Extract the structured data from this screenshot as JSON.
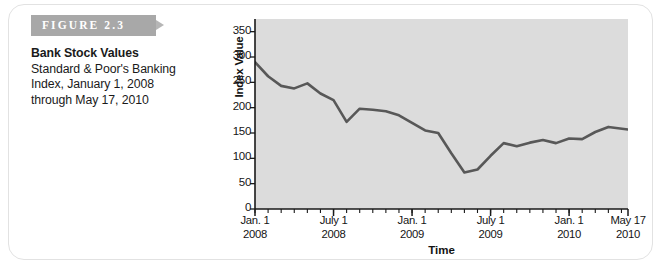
{
  "figure": {
    "banner_label": "FIGURE 2.3",
    "title": "Bank Stock Values",
    "subtitle_line1": "Standard & Poor's Banking",
    "subtitle_line2": "Index, January 1, 2008",
    "subtitle_line3": "through May 17, 2010"
  },
  "colors": {
    "banner": "#a8a8a8",
    "plot_background": "#dcdcdc",
    "line": "#585858",
    "axis": "#1a1a1a",
    "border": "#e2e2e2"
  },
  "chart_data": {
    "type": "line",
    "title": "Bank Stock Values",
    "xlabel": "Time",
    "ylabel": "Index Value",
    "ylim": [
      0,
      375
    ],
    "yticks": [
      0,
      50,
      100,
      150,
      200,
      250,
      300,
      350
    ],
    "ytick_labels": [
      "0",
      "50",
      "100",
      "150",
      "200",
      "250",
      "300",
      "350"
    ],
    "grid": false,
    "legend": "none",
    "xlim": [
      0,
      28.5
    ],
    "xtick_positions": [
      0,
      6,
      12,
      18,
      24,
      28.5
    ],
    "xtick_labels": [
      {
        "line1": "Jan. 1",
        "line2": "2008"
      },
      {
        "line1": "July 1",
        "line2": "2008"
      },
      {
        "line1": "Jan. 1",
        "line2": "2009"
      },
      {
        "line1": "July 1",
        "line2": "2009"
      },
      {
        "line1": "Jan. 1",
        "line2": "2010"
      },
      {
        "line1": "May 17",
        "line2": "2010"
      }
    ],
    "x_minor_tick_interval": 1,
    "series": [
      {
        "name": "S&P Banking Index",
        "x": [
          0,
          1,
          2,
          3,
          4,
          5,
          6,
          7,
          8,
          9,
          10,
          11,
          12,
          13,
          14,
          15,
          16,
          17,
          18,
          19,
          20,
          21,
          22,
          23,
          24,
          25,
          26,
          27,
          28.5
        ],
        "values": [
          290,
          262,
          243,
          238,
          248,
          228,
          215,
          172,
          198,
          196,
          193,
          185,
          170,
          155,
          150,
          110,
          72,
          78,
          105,
          130,
          124,
          131,
          136,
          130,
          139,
          138,
          152,
          162,
          157
        ]
      }
    ]
  }
}
